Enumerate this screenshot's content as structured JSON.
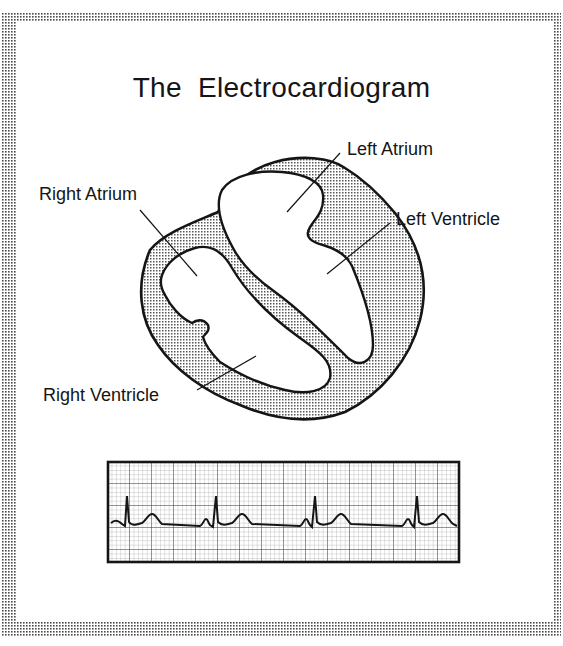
{
  "title": "The  Electrocardiogram",
  "heart": {
    "labels": [
      {
        "id": "left-atrium",
        "text": "Left Atrium"
      },
      {
        "id": "left-ventricle",
        "text": "Left Ventricle"
      },
      {
        "id": "right-atrium",
        "text": "Right Atrium"
      },
      {
        "id": "right-ventricle",
        "text": "Right Ventricle"
      }
    ]
  },
  "ecg_strip": {
    "beats": 4,
    "waves": [
      "P",
      "QRS",
      "T"
    ]
  },
  "colors": {
    "ink": "#151515",
    "halftone": "#555555",
    "grid_minor": "#9a9a9a",
    "grid_major": "#3a3a3a"
  }
}
